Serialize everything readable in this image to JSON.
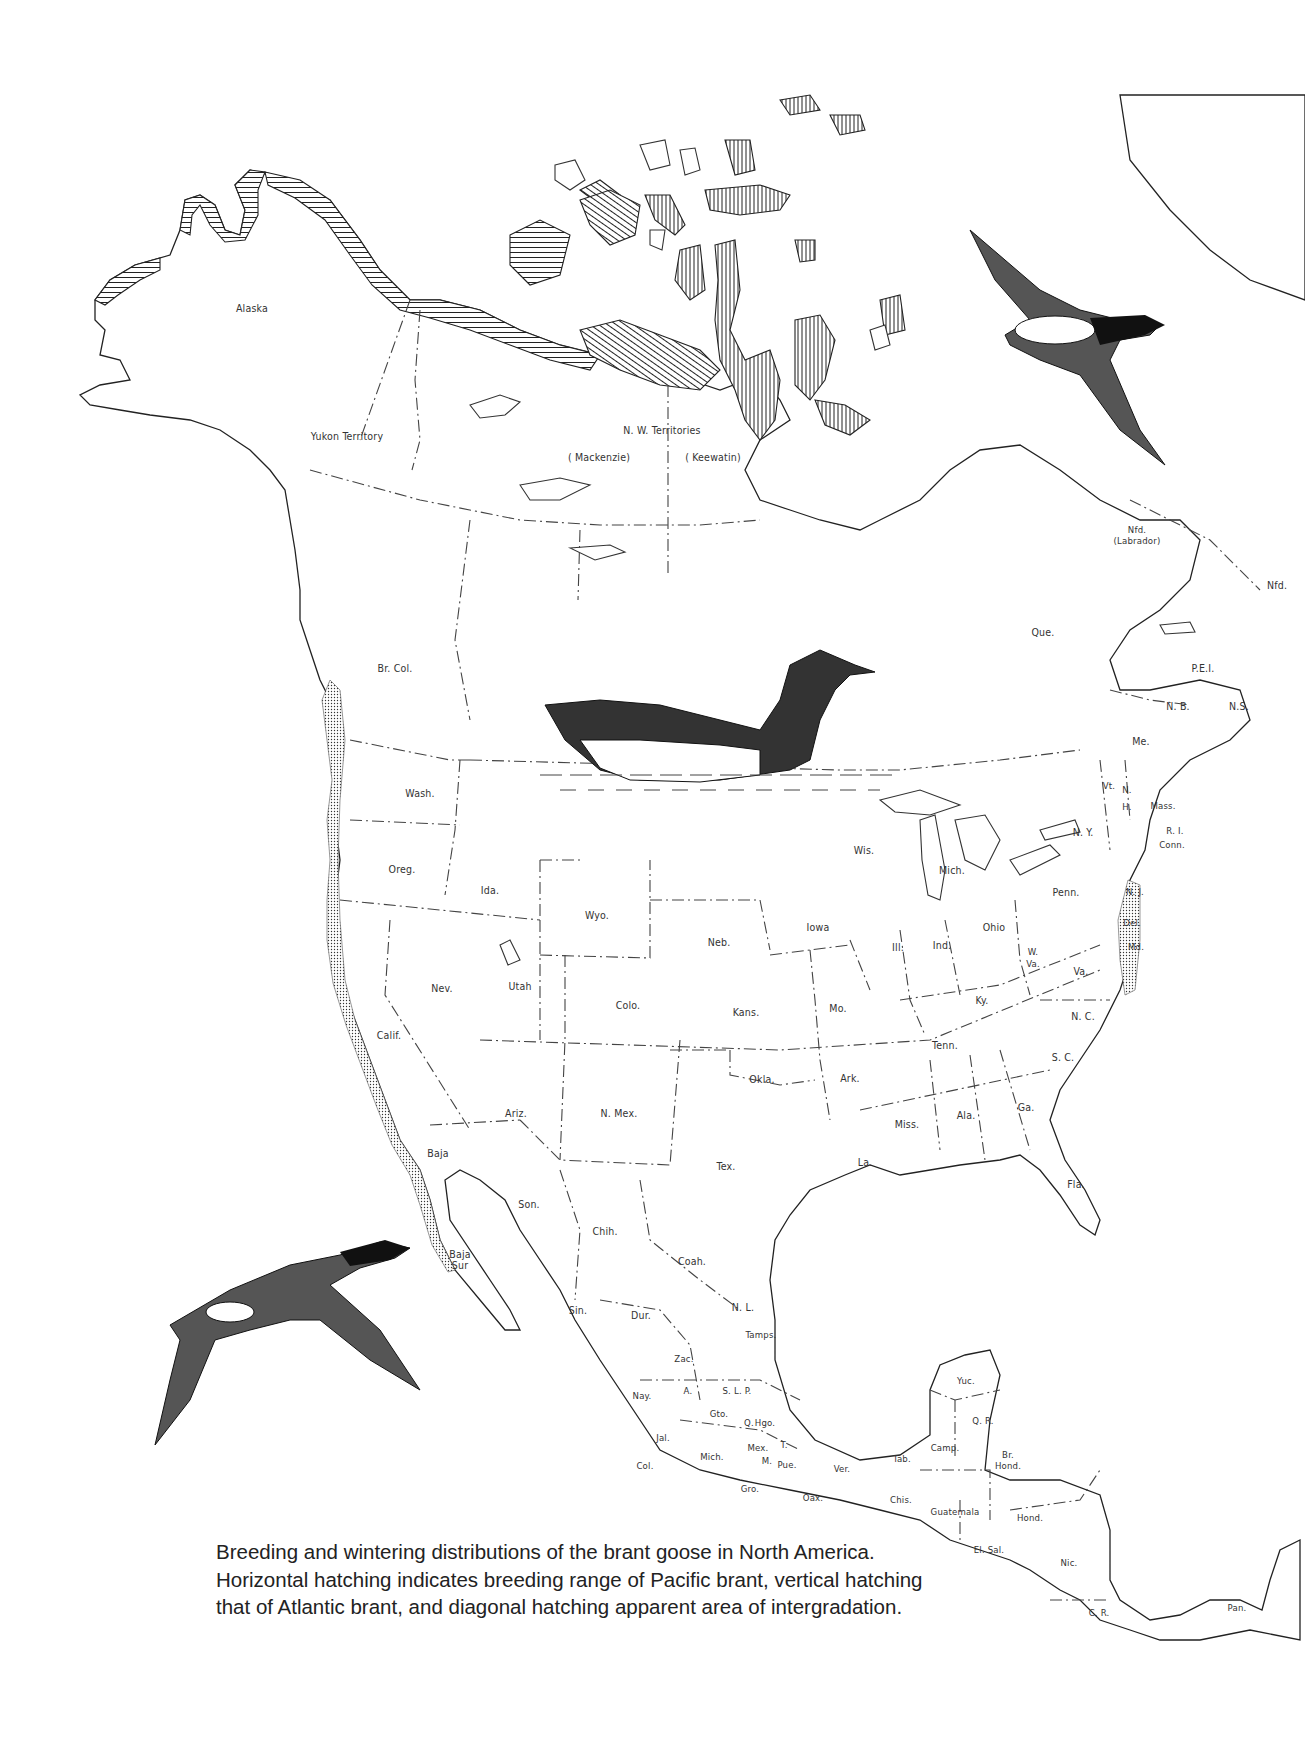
{
  "figure": {
    "caption": "Breeding and wintering distributions of the brant goose in North America. Horizontal hatching indicates breeding range of Pacific brant, vertical hatching that of Atlantic brant, and diagonal hatching apparent area of intergradation."
  },
  "legend": {
    "horizontal_hatching": "Pacific brant breeding range",
    "vertical_hatching": "Atlantic brant breeding range",
    "diagonal_hatching": "apparent area of intergradation",
    "stippling": "wintering range (coastal)"
  },
  "labels": {
    "canada_territories": [
      {
        "name": "Alaska",
        "x": 252,
        "y": 308
      },
      {
        "name": "Yukon Territory",
        "x": 347,
        "y": 436
      },
      {
        "name": "N. W. Territories",
        "x": 662,
        "y": 430
      },
      {
        "name": "( Mackenzie)",
        "x": 599,
        "y": 457
      },
      {
        "name": "( Keewatin)",
        "x": 713,
        "y": 457
      },
      {
        "name": "Nfd. (Labrador)",
        "x": 1137,
        "y": 535
      },
      {
        "name": "Nfd.",
        "x": 1277,
        "y": 585
      },
      {
        "name": "Que.",
        "x": 1043,
        "y": 632
      },
      {
        "name": "Br. Col.",
        "x": 395,
        "y": 668
      },
      {
        "name": "P.E.I.",
        "x": 1203,
        "y": 668
      },
      {
        "name": "N. B.",
        "x": 1178,
        "y": 706
      },
      {
        "name": "N.S.",
        "x": 1239,
        "y": 706
      }
    ],
    "us_states": [
      {
        "name": "Me.",
        "x": 1141,
        "y": 741
      },
      {
        "name": "Vt.",
        "x": 1109,
        "y": 785
      },
      {
        "name": "N.",
        "x": 1127,
        "y": 789
      },
      {
        "name": "H.",
        "x": 1127,
        "y": 806
      },
      {
        "name": "Mass.",
        "x": 1163,
        "y": 805
      },
      {
        "name": "N. Y.",
        "x": 1083,
        "y": 832
      },
      {
        "name": "R. I.",
        "x": 1175,
        "y": 830
      },
      {
        "name": "Conn.",
        "x": 1172,
        "y": 844
      },
      {
        "name": "Wash.",
        "x": 420,
        "y": 793
      },
      {
        "name": "Oreg.",
        "x": 402,
        "y": 869
      },
      {
        "name": "Ida.",
        "x": 490,
        "y": 890
      },
      {
        "name": "Wyo.",
        "x": 597,
        "y": 915
      },
      {
        "name": "Wis.",
        "x": 864,
        "y": 850
      },
      {
        "name": "Mich.",
        "x": 952,
        "y": 870
      },
      {
        "name": "Penn.",
        "x": 1066,
        "y": 892
      },
      {
        "name": "N. J.",
        "x": 1135,
        "y": 891
      },
      {
        "name": "Neb.",
        "x": 719,
        "y": 942
      },
      {
        "name": "Iowa",
        "x": 818,
        "y": 927
      },
      {
        "name": "Ohio",
        "x": 994,
        "y": 927
      },
      {
        "name": "Del.",
        "x": 1132,
        "y": 922
      },
      {
        "name": "Ill.",
        "x": 898,
        "y": 947
      },
      {
        "name": "Ind.",
        "x": 942,
        "y": 945
      },
      {
        "name": "W. Va.",
        "x": 1033,
        "y": 958
      },
      {
        "name": "Md.",
        "x": 1136,
        "y": 946
      },
      {
        "name": "Nev.",
        "x": 442,
        "y": 988
      },
      {
        "name": "Utah",
        "x": 520,
        "y": 986
      },
      {
        "name": "Colo.",
        "x": 628,
        "y": 1005
      },
      {
        "name": "Kans.",
        "x": 746,
        "y": 1012
      },
      {
        "name": "Mo.",
        "x": 838,
        "y": 1008
      },
      {
        "name": "Ky.",
        "x": 982,
        "y": 1000
      },
      {
        "name": "Va.",
        "x": 1081,
        "y": 971
      },
      {
        "name": "N. C.",
        "x": 1083,
        "y": 1016
      },
      {
        "name": "Calif.",
        "x": 389,
        "y": 1035
      },
      {
        "name": "Tenn.",
        "x": 945,
        "y": 1045
      },
      {
        "name": "S. C.",
        "x": 1063,
        "y": 1057
      },
      {
        "name": "Okla.",
        "x": 762,
        "y": 1079
      },
      {
        "name": "Ark.",
        "x": 850,
        "y": 1078
      },
      {
        "name": "Ariz.",
        "x": 516,
        "y": 1113
      },
      {
        "name": "N. Mex.",
        "x": 619,
        "y": 1113
      },
      {
        "name": "Ga.",
        "x": 1026,
        "y": 1107
      },
      {
        "name": "Ala.",
        "x": 966,
        "y": 1115
      },
      {
        "name": "Miss.",
        "x": 907,
        "y": 1124
      },
      {
        "name": "Tex.",
        "x": 726,
        "y": 1166
      },
      {
        "name": "La.",
        "x": 865,
        "y": 1162
      },
      {
        "name": "Fla.",
        "x": 1076,
        "y": 1184
      }
    ],
    "mexico_central_america": [
      {
        "name": "Baja",
        "x": 438,
        "y": 1153
      },
      {
        "name": "Son.",
        "x": 529,
        "y": 1204
      },
      {
        "name": "Chih.",
        "x": 605,
        "y": 1231
      },
      {
        "name": "Baja Sur",
        "x": 460,
        "y": 1260
      },
      {
        "name": "Coah.",
        "x": 692,
        "y": 1261
      },
      {
        "name": "Sin.",
        "x": 578,
        "y": 1310
      },
      {
        "name": "Dur.",
        "x": 641,
        "y": 1315
      },
      {
        "name": "N. L.",
        "x": 743,
        "y": 1307
      },
      {
        "name": "Tamps.",
        "x": 761,
        "y": 1334
      },
      {
        "name": "Zac.",
        "x": 684,
        "y": 1358
      },
      {
        "name": "Nay.",
        "x": 642,
        "y": 1395
      },
      {
        "name": "A.",
        "x": 688,
        "y": 1390
      },
      {
        "name": "S. L. P.",
        "x": 737,
        "y": 1390
      },
      {
        "name": "Yuc.",
        "x": 966,
        "y": 1380
      },
      {
        "name": "Gto.",
        "x": 719,
        "y": 1413
      },
      {
        "name": "Q.",
        "x": 749,
        "y": 1422
      },
      {
        "name": "Hgo.",
        "x": 765,
        "y": 1422
      },
      {
        "name": "Q. R.",
        "x": 983,
        "y": 1420
      },
      {
        "name": "Jal.",
        "x": 663,
        "y": 1437
      },
      {
        "name": "Mex.",
        "x": 758,
        "y": 1447
      },
      {
        "name": "T.",
        "x": 784,
        "y": 1444
      },
      {
        "name": "Camp.",
        "x": 945,
        "y": 1447
      },
      {
        "name": "Tab.",
        "x": 902,
        "y": 1458
      },
      {
        "name": "Mich.",
        "x": 712,
        "y": 1456
      },
      {
        "name": "M.",
        "x": 767,
        "y": 1460
      },
      {
        "name": "Pue.",
        "x": 787,
        "y": 1464
      },
      {
        "name": "Ver.",
        "x": 842,
        "y": 1468
      },
      {
        "name": "Br. Hond.",
        "x": 1008,
        "y": 1460
      },
      {
        "name": "Col.",
        "x": 645,
        "y": 1465
      },
      {
        "name": "Gro.",
        "x": 750,
        "y": 1488
      },
      {
        "name": "Oax.",
        "x": 813,
        "y": 1497
      },
      {
        "name": "Chis.",
        "x": 901,
        "y": 1499
      },
      {
        "name": "Guatemala",
        "x": 955,
        "y": 1511
      },
      {
        "name": "Hond.",
        "x": 1030,
        "y": 1517
      },
      {
        "name": "El. Sal.",
        "x": 989,
        "y": 1549
      },
      {
        "name": "Nic.",
        "x": 1069,
        "y": 1562
      },
      {
        "name": "C. R.",
        "x": 1099,
        "y": 1612
      },
      {
        "name": "Pan.",
        "x": 1237,
        "y": 1607
      }
    ]
  },
  "illustrations": [
    {
      "name": "brant-flying-northeast",
      "x": 970,
      "y": 230
    },
    {
      "name": "brant-swimming",
      "x": 540,
      "y": 625
    },
    {
      "name": "brant-flying-west",
      "x": 150,
      "y": 1230
    }
  ]
}
